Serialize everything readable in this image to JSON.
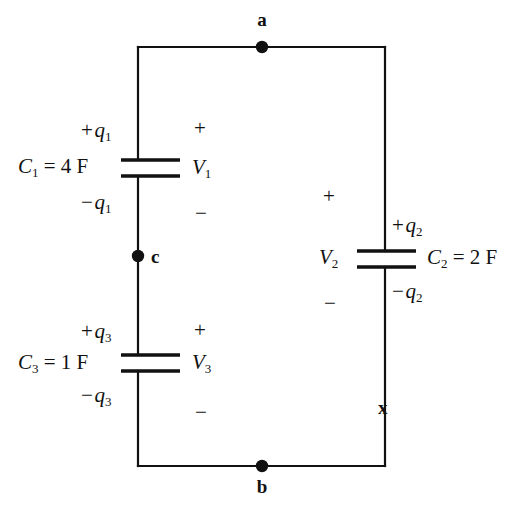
{
  "figure": {
    "type": "circuit-diagram",
    "background_color": "#ffffff",
    "line_color": "#111111"
  },
  "nodes": [
    {
      "id": "a",
      "label": "a",
      "x": 262,
      "y": 47,
      "label_x": 262,
      "label_y": 18,
      "dot": true
    },
    {
      "id": "b",
      "label": "b",
      "x": 262,
      "y": 466,
      "label_x": 262,
      "label_y": 483,
      "dot": true
    },
    {
      "id": "c",
      "label": "c",
      "x": 138,
      "y": 256,
      "label_x": 151,
      "label_y": 246,
      "dot": true
    },
    {
      "id": "x",
      "label": "x",
      "x": 385,
      "y": 407,
      "label_x": 378,
      "label_y": 397,
      "dot": false
    }
  ],
  "wires": {
    "left_x": 138,
    "right_x": 385,
    "top_y": 47,
    "bottom_y": 466,
    "stroke_width": 2.2
  },
  "capacitors": [
    {
      "id": "C1",
      "branch": "left",
      "plate_top_y": 160,
      "plate_bottom_y": 176,
      "plate_x_start": 121,
      "plate_x_end": 180,
      "value_label": "C₁ = 4 F",
      "symbol": "C",
      "subscript": "1",
      "value_text": " = 4 F",
      "charge_top": "+ q₁",
      "charge_top_sign": "+ ",
      "charge_top_var": "q",
      "charge_top_sub": "1",
      "charge_bottom_sign": "− ",
      "charge_bottom_var": "q",
      "charge_bottom_sub": "1",
      "voltage_symbol": "V",
      "voltage_sub": "1",
      "polarity_top": "+",
      "polarity_bottom": "−"
    },
    {
      "id": "C2",
      "branch": "right",
      "plate_top_y": 251,
      "plate_bottom_y": 267,
      "plate_x_start": 357,
      "plate_x_end": 416,
      "value_label": "C₂ = 2 F",
      "symbol": "C",
      "subscript": "2",
      "value_text": " = 2 F",
      "charge_top_sign": "+ ",
      "charge_top_var": "q",
      "charge_top_sub": "2",
      "charge_bottom_sign": "− ",
      "charge_bottom_var": "q",
      "charge_bottom_sub": "2",
      "voltage_symbol": "V",
      "voltage_sub": "2",
      "polarity_top": "+",
      "polarity_bottom": "−"
    },
    {
      "id": "C3",
      "branch": "left",
      "plate_top_y": 355,
      "plate_bottom_y": 371,
      "plate_x_start": 121,
      "plate_x_end": 180,
      "value_label": "C₃ = 1 F",
      "symbol": "C",
      "subscript": "3",
      "value_text": " = 1 F",
      "charge_top_sign": "+ ",
      "charge_top_var": "q",
      "charge_top_sub": "3",
      "charge_bottom_sign": "− ",
      "charge_bottom_var": "q",
      "charge_bottom_sub": "3",
      "voltage_symbol": "V",
      "voltage_sub": "3",
      "polarity_top": "+",
      "polarity_bottom": "−"
    }
  ],
  "labels": {
    "c1_symbol": "C",
    "c1_sub": "1",
    "c1_value": " = 4 F",
    "c2_symbol": "C",
    "c2_sub": "2",
    "c2_value": " = 2 F",
    "c3_symbol": "C",
    "c3_sub": "3",
    "c3_value": " = 1 F",
    "q1_plus_sign": "+",
    "q1_plus_var": "q",
    "q1_plus_sub": "1",
    "q1_minus_sign": "−",
    "q1_minus_var": "q",
    "q1_minus_sub": "1",
    "q2_plus_sign": "+",
    "q2_plus_var": "q",
    "q2_plus_sub": "2",
    "q2_minus_sign": "−",
    "q2_minus_var": "q",
    "q2_minus_sub": "2",
    "q3_plus_sign": "+",
    "q3_plus_var": "q",
    "q3_plus_sub": "3",
    "q3_minus_sign": "−",
    "q3_minus_var": "q",
    "q3_minus_sub": "3",
    "v1_symbol": "V",
    "v1_sub": "1",
    "v2_symbol": "V",
    "v2_sub": "2",
    "v3_symbol": "V",
    "v3_sub": "3",
    "v1_plus": "+",
    "v1_minus": "−",
    "v2_plus": "+",
    "v2_minus": "−",
    "v3_plus": "+",
    "v3_minus": "−",
    "node_a": "a",
    "node_b": "b",
    "node_c": "c",
    "marker_x": "x"
  }
}
